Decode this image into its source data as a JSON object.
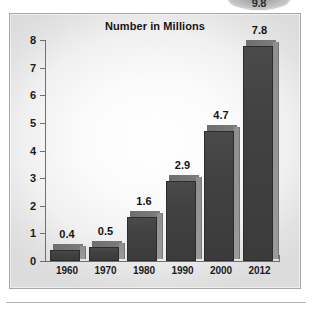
{
  "top_badge": {
    "label": "9.8",
    "name": "cropped-badge"
  },
  "chart_data": {
    "type": "bar",
    "title": "Number in Millions",
    "xlabel": "",
    "ylabel": "",
    "categories": [
      "1960",
      "1970",
      "1980",
      "1990",
      "2000",
      "2012"
    ],
    "values": [
      0.4,
      0.5,
      1.6,
      2.9,
      4.7,
      7.8
    ],
    "value_labels": [
      "0.4",
      "0.5",
      "1.6",
      "2.9",
      "4.7",
      "7.8"
    ],
    "ylim": [
      0,
      8
    ],
    "ytick_labels": [
      "0",
      "1",
      "2",
      "3",
      "4",
      "5",
      "6",
      "7",
      "8"
    ],
    "ytick_values": [
      0,
      1,
      2,
      3,
      4,
      5,
      6,
      7,
      8
    ],
    "grid": false,
    "legend": null,
    "legend_position": "none",
    "bar_color": "#3f3f3f",
    "bar_side_color": "#949494",
    "axis_color": "#6f6f6f",
    "panel_border_color": "#a8a8a8",
    "series": [
      {
        "name": "Number in Millions",
        "values": [
          0.4,
          0.5,
          1.6,
          2.9,
          4.7,
          7.8
        ]
      }
    ]
  }
}
